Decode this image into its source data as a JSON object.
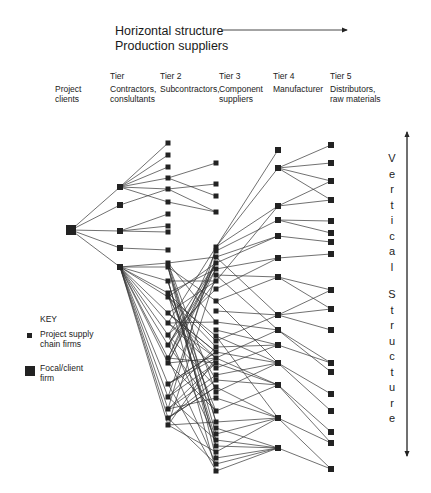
{
  "header": {
    "title_line1": "Horizontal structure",
    "title_line2": "Production suppliers"
  },
  "columns": [
    {
      "id": "clients",
      "tier": "",
      "line1": "Project",
      "line2": "clients"
    },
    {
      "id": "tier1",
      "tier": "Tier",
      "line1": "Contractors,",
      "line2": "conslultants"
    },
    {
      "id": "tier2",
      "tier": "Tier 2",
      "line1": "Subcontractors,",
      "line2": ""
    },
    {
      "id": "tier3",
      "tier": "Tier 3",
      "line1": "Component",
      "line2": "suppliers"
    },
    {
      "id": "tier4",
      "tier": "Tier 4",
      "line1": "Manufacturer",
      "line2": ""
    },
    {
      "id": "tier5",
      "tier": "Tier 5",
      "line1": "Distributors,",
      "line2": "raw materials"
    }
  ],
  "key": {
    "title": "KEY",
    "item1_line1": "Project supply",
    "item1_line2": "chain firms",
    "item2_line1": "Focal/client",
    "item2_line2": "firm"
  },
  "vertical_label": {
    "word1": [
      "V",
      "e",
      "r",
      "t",
      "i",
      "c",
      "a",
      "l"
    ],
    "word2": [
      "S",
      "t",
      "r",
      "u",
      "c",
      "t",
      "u",
      "r",
      "e"
    ]
  },
  "colors": {
    "node": "#222222",
    "line": "#333333",
    "text": "#1a1a1a"
  },
  "network": {
    "focal": {
      "x": 71,
      "y": 230
    },
    "tier1": {
      "x": 120,
      "ys": [
        187,
        205,
        231,
        248,
        267
      ]
    },
    "tier2": {
      "x": 168,
      "ys": [
        143,
        155,
        167,
        178,
        189,
        202,
        214,
        226,
        232,
        250,
        263,
        267,
        281,
        293,
        297,
        313,
        323,
        335,
        345,
        358,
        363,
        384,
        397,
        409,
        418,
        425
      ]
    },
    "tier3": {
      "x": 216,
      "ys": [
        163,
        184,
        196,
        212,
        247,
        251,
        257,
        263,
        269,
        275,
        281,
        289,
        301,
        311,
        322,
        330,
        336,
        341,
        347,
        352,
        358,
        363,
        368,
        375,
        380,
        387,
        392,
        398,
        411,
        422,
        428,
        434,
        440,
        446,
        452,
        458,
        464,
        471
      ]
    },
    "tier4": {
      "x": 278,
      "ys": [
        150,
        168,
        206,
        220,
        236,
        258,
        277,
        315,
        330,
        345,
        363,
        385,
        418,
        448
      ]
    },
    "tier5": {
      "x": 331,
      "ys": [
        145,
        163,
        181,
        200,
        221,
        233,
        242,
        254,
        290,
        309,
        330,
        363,
        372,
        394,
        411,
        432,
        443,
        469
      ]
    }
  }
}
